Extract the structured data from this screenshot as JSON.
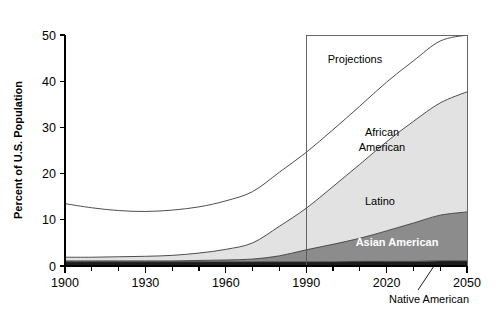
{
  "chart_data": {
    "type": "area",
    "title": "Share of Minorities in the U.S. Population, 1900–2050",
    "xlabel": "",
    "ylabel": "Percent of U.S. Population",
    "xlim": [
      1900,
      2050
    ],
    "ylim": [
      0,
      50
    ],
    "grid": false,
    "legend_position": "inline-labels",
    "stacked": true,
    "x": [
      1900,
      1910,
      1920,
      1930,
      1940,
      1950,
      1960,
      1970,
      1980,
      1990,
      2000,
      2010,
      2020,
      2030,
      2040,
      2050
    ],
    "xticks": [
      1900,
      1930,
      1960,
      1990,
      2020,
      2050
    ],
    "xtick_labels": [
      "1900",
      "1930",
      "1960",
      "1990",
      "2020",
      "2050"
    ],
    "xminor_tick_step": 10,
    "yticks": [
      0,
      10,
      20,
      30,
      40,
      50
    ],
    "ytick_labels": [
      "0",
      "10",
      "20",
      "30",
      "40",
      "50"
    ],
    "series": [
      {
        "name": "Native American",
        "label": "Native American",
        "label_placement": "callout-below-axis",
        "color": "#1c1c1c",
        "values": [
          0.9,
          0.9,
          0.9,
          0.9,
          0.9,
          0.9,
          0.9,
          0.9,
          0.9,
          0.9,
          0.9,
          1.0,
          1.0,
          1.0,
          1.1,
          1.1
        ]
      },
      {
        "name": "Asian American",
        "label": "Asian American",
        "label_placement": "inside-band",
        "color": "#8c8c8c",
        "values": [
          0.2,
          0.2,
          0.2,
          0.2,
          0.2,
          0.3,
          0.4,
          0.6,
          1.3,
          2.6,
          3.8,
          5.0,
          6.6,
          8.3,
          9.9,
          10.6
        ]
      },
      {
        "name": "Latino",
        "label": "Latino",
        "label_placement": "inside-band",
        "color": "#e2e2e2",
        "values": [
          0.8,
          0.8,
          0.9,
          1.0,
          1.2,
          1.6,
          2.3,
          3.5,
          6.4,
          9.0,
          12.5,
          16.0,
          19.3,
          22.0,
          24.3,
          26.0
        ]
      },
      {
        "name": "African American",
        "label": "African American",
        "label_placement": "inside-band",
        "color": "#ffffff",
        "values": [
          11.6,
          10.7,
          10.0,
          9.7,
          9.8,
          10.0,
          10.5,
          11.1,
          11.7,
          12.1,
          12.3,
          12.6,
          12.9,
          13.1,
          13.4,
          13.6
        ]
      }
    ],
    "totals": [
      13.5,
      12.6,
      12.0,
      11.8,
      12.1,
      12.8,
      14.1,
      16.1,
      20.3,
      24.6,
      29.5,
      34.6,
      39.8,
      44.4,
      48.7,
      51.3
    ],
    "annotations": [
      {
        "name": "projections",
        "text": "Projections",
        "start_x": 1990,
        "end_x": 2050,
        "top_y": 50,
        "description": "Boxed region marking projected years from 1990 onward"
      }
    ]
  },
  "labels": {
    "projections": "Projections",
    "african_american": "African American",
    "african_american_line1": "African",
    "african_american_line2": "American",
    "latino": "Latino",
    "asian_american": "Asian American",
    "native_american": "Native American"
  },
  "colors": {
    "native_american": "#1c1c1c",
    "asian_american": "#8c8c8c",
    "latino": "#e2e2e2",
    "african_american": "#ffffff",
    "axis": "#000000",
    "edge": "#3a3a3a",
    "background": "#ffffff"
  }
}
